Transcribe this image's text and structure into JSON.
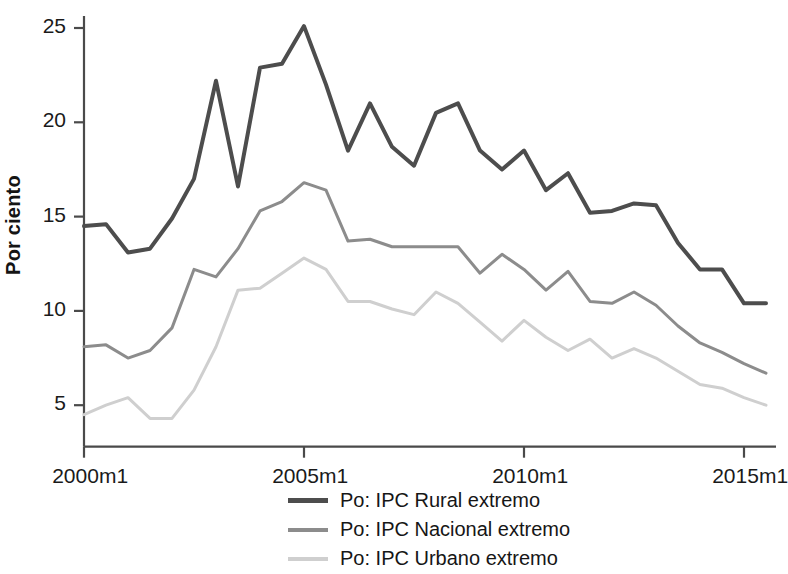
{
  "chart_data": {
    "type": "line",
    "title": "",
    "xlabel": "",
    "ylabel": "Por ciento",
    "xlim": [
      2000,
      2015.5
    ],
    "ylim": [
      2.8,
      25.8
    ],
    "yticks": [
      5,
      10,
      15,
      20,
      25
    ],
    "ytick_labels": [
      "5",
      "10",
      "15",
      "20",
      "25"
    ],
    "xticks": [
      2000,
      2005,
      2010,
      2015
    ],
    "xtick_labels": [
      "2000m1",
      "2005m1",
      "2010m1",
      "2015m1"
    ],
    "grid": false,
    "legend_position": "bottom-center",
    "x": [
      2000,
      2000.5,
      2001,
      2001.5,
      2002,
      2002.5,
      2003,
      2003.5,
      2004,
      2004.5,
      2005,
      2005.5,
      2006,
      2006.5,
      2007,
      2007.5,
      2008,
      2008.5,
      2009,
      2009.5,
      2010,
      2010.5,
      2011,
      2011.5,
      2012,
      2012.5,
      2013,
      2013.5,
      2014,
      2014.5,
      2015,
      2015.5
    ],
    "series": [
      {
        "name": "Po: IPC Rural extremo",
        "color": "#4d4d4d",
        "width": 4,
        "values": [
          14.5,
          14.6,
          13.1,
          13.3,
          14.9,
          17.0,
          22.2,
          16.6,
          22.9,
          23.1,
          25.1,
          22.0,
          18.5,
          21.0,
          18.7,
          17.7,
          20.5,
          21.0,
          18.5,
          17.5,
          18.5,
          16.4,
          17.3,
          15.2,
          15.3,
          15.7,
          15.6,
          13.6,
          12.2,
          12.2,
          10.4,
          10.4
        ]
      },
      {
        "name": "Po: IPC Nacional extremo",
        "color": "#8c8c8c",
        "width": 3,
        "values": [
          8.1,
          8.2,
          7.5,
          7.9,
          9.1,
          12.2,
          11.8,
          13.3,
          15.3,
          15.8,
          16.8,
          16.4,
          13.7,
          13.8,
          13.4,
          13.4,
          13.4,
          13.4,
          12.0,
          13.0,
          12.2,
          11.1,
          12.1,
          10.5,
          10.4,
          11.0,
          10.3,
          9.2,
          8.3,
          7.8,
          7.2,
          6.7
        ]
      },
      {
        "name": "Po: IPC Urbano extremo",
        "color": "#cfcfcf",
        "width": 3,
        "values": [
          4.5,
          5.0,
          5.4,
          4.3,
          4.3,
          5.8,
          8.1,
          11.1,
          11.2,
          12.0,
          12.8,
          12.2,
          10.5,
          10.5,
          10.1,
          9.8,
          11.0,
          10.4,
          9.4,
          8.4,
          9.5,
          8.6,
          7.9,
          8.5,
          7.5,
          8.0,
          7.5,
          6.8,
          6.1,
          5.9,
          5.4,
          5.0
        ]
      }
    ]
  },
  "axis": {
    "y_title": "Por ciento"
  },
  "legend": {
    "items": [
      {
        "label": "Po: IPC Rural extremo",
        "color": "#4d4d4d"
      },
      {
        "label": "Po: IPC Nacional extremo",
        "color": "#8c8c8c"
      },
      {
        "label": "Po: IPC Urbano extremo",
        "color": "#cfcfcf"
      }
    ]
  }
}
